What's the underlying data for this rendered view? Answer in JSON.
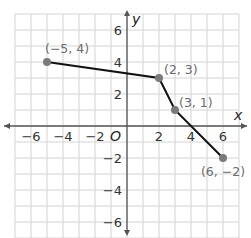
{
  "chart_data": {
    "type": "line",
    "title": "",
    "xlabel": "x",
    "ylabel": "y",
    "xlim": [
      -7,
      7
    ],
    "ylim": [
      -7,
      7
    ],
    "grid": true,
    "grid_step": 1,
    "origin_label": "O",
    "x_ticks": [
      -6,
      -4,
      -2,
      2,
      4,
      6
    ],
    "y_ticks": [
      6,
      4,
      2,
      -2,
      -4,
      -6
    ],
    "x_tick_labels": [
      "−6",
      "−4",
      "−2",
      "2",
      "4",
      "6"
    ],
    "y_tick_labels": [
      "6",
      "4",
      "2",
      "−2",
      "−4",
      "−6"
    ],
    "series": [
      {
        "name": "piecewise",
        "points": [
          {
            "x": -5,
            "y": 4,
            "label": "(−5, 4)"
          },
          {
            "x": 2,
            "y": 3,
            "label": "(2, 3)"
          },
          {
            "x": 3,
            "y": 1,
            "label": "(3, 1)"
          },
          {
            "x": 6,
            "y": -2,
            "label": "(6, −2)"
          }
        ]
      }
    ],
    "colors": {
      "grid": "#d4d4d4",
      "axis": "#555555",
      "line": "#111111",
      "point": "#7a7a7a",
      "point_label": "#6b6b6b"
    }
  }
}
